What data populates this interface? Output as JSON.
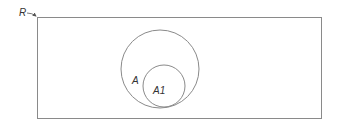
{
  "diagram": {
    "type": "venn",
    "universe": {
      "label": "R",
      "x": 37,
      "y": 17,
      "width": 284,
      "height": 101
    },
    "sets": [
      {
        "label": "A",
        "cx": 160,
        "cy": 69,
        "r": 39,
        "label_x": 119,
        "label_y": 84
      },
      {
        "label": "A1",
        "cx": 164,
        "cy": 86,
        "r": 21,
        "label_x": 153,
        "label_y": 94
      }
    ],
    "stroke_color": "#8a8a8a",
    "text_color": "#333333"
  }
}
